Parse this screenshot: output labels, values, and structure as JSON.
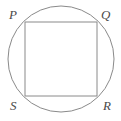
{
  "figure": {
    "background_color": "#ffffff",
    "stroke_color": "#8a8a8a",
    "label_color": "#4a4a4a",
    "stroke_width": 1,
    "circle": {
      "name": "circumscribed-circle",
      "center_x": 61,
      "center_y": 59,
      "radius": 53
    },
    "square": {
      "name": "inscribed-square",
      "left": 25,
      "top": 22,
      "right": 97,
      "bottom": 96,
      "width": 72,
      "height": 74
    },
    "vertices": [
      {
        "id": "P",
        "label": "P",
        "position": "top-left",
        "x": 25,
        "y": 22
      },
      {
        "id": "Q",
        "label": "Q",
        "position": "top-right",
        "x": 97,
        "y": 22
      },
      {
        "id": "R",
        "label": "R",
        "position": "bottom-right",
        "x": 97,
        "y": 96
      },
      {
        "id": "S",
        "label": "S",
        "position": "bottom-left",
        "x": 25,
        "y": 96
      }
    ]
  }
}
